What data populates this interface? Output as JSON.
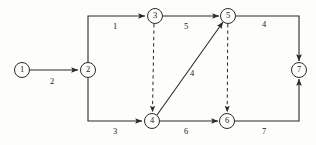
{
  "diagram": {
    "type": "directed-graph",
    "width": 316,
    "height": 145,
    "stroke_color": "#2b2b2b",
    "background_color": "#fdfdfc",
    "nodes": [
      {
        "id": "1",
        "label": "1",
        "x": 22,
        "y": 70,
        "r": 7.5
      },
      {
        "id": "2",
        "label": "2",
        "x": 88,
        "y": 70,
        "r": 7.5
      },
      {
        "id": "3",
        "label": "3",
        "x": 155,
        "y": 16,
        "r": 7.5
      },
      {
        "id": "4",
        "label": "4",
        "x": 152,
        "y": 121,
        "r": 7.5
      },
      {
        "id": "5",
        "label": "5",
        "x": 228,
        "y": 16,
        "r": 7.5
      },
      {
        "id": "6",
        "label": "6",
        "x": 227,
        "y": 121,
        "r": 7.5
      },
      {
        "id": "7",
        "label": "7",
        "x": 299,
        "y": 70,
        "r": 7.5
      }
    ],
    "edges": [
      {
        "id": "e1-2",
        "from": "1",
        "to": "2",
        "weight": "2",
        "style": "solid",
        "label_x": 52,
        "label_y": 82
      },
      {
        "id": "e2-3",
        "from": "2",
        "to": "3",
        "weight": "1",
        "style": "solid",
        "label_x": 115,
        "label_y": 27
      },
      {
        "id": "e2-4",
        "from": "2",
        "to": "4",
        "weight": "3",
        "style": "solid",
        "label_x": 115,
        "label_y": 132
      },
      {
        "id": "e3-5",
        "from": "3",
        "to": "5",
        "weight": "5",
        "style": "solid",
        "label_x": 186,
        "label_y": 27
      },
      {
        "id": "e5-7",
        "from": "5",
        "to": "7",
        "weight": "4",
        "style": "solid",
        "label_x": 264,
        "label_y": 25
      },
      {
        "id": "e4-6",
        "from": "4",
        "to": "6",
        "weight": "6",
        "style": "solid",
        "label_x": 186,
        "label_y": 132
      },
      {
        "id": "e6-7",
        "from": "6",
        "to": "7",
        "weight": "7",
        "style": "solid",
        "label_x": 264,
        "label_y": 132
      },
      {
        "id": "e4-5",
        "from": "4",
        "to": "5",
        "weight": "4",
        "style": "solid",
        "label_x": 192,
        "label_y": 74
      },
      {
        "id": "e3-4",
        "from": "3",
        "to": "4",
        "weight": "",
        "style": "dashed",
        "label_x": 0,
        "label_y": 0
      },
      {
        "id": "e5-6",
        "from": "5",
        "to": "6",
        "weight": "",
        "style": "dashed",
        "label_x": 0,
        "label_y": 0
      }
    ]
  }
}
